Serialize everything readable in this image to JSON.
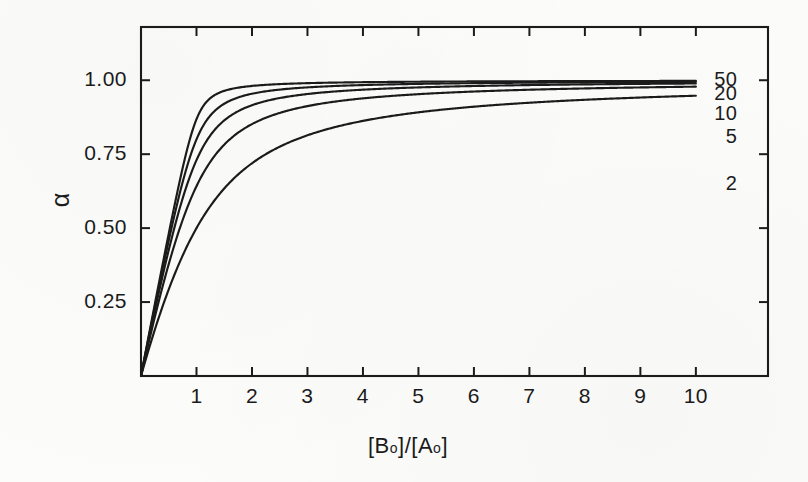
{
  "figure": {
    "background_color": "#fcfcfb",
    "ink_color": "#1b1b1b"
  },
  "chart_data": {
    "type": "line",
    "title": "",
    "xlabel": "[B₀]/[A₀]",
    "xlabel_parts": {
      "open_b": "[B",
      "sub_b": "o",
      "close_b_slash_open_a": "]/[A",
      "sub_a": "o",
      "close_a": "]"
    },
    "ylabel": "α",
    "xlim": [
      0,
      11.3
    ],
    "ylim": [
      0,
      1.18
    ],
    "xticks": [
      1,
      2,
      3,
      4,
      5,
      6,
      7,
      8,
      9,
      10
    ],
    "xtick_labels": [
      "1",
      "2",
      "3",
      "4",
      "5",
      "6",
      "7",
      "8",
      "9",
      "10"
    ],
    "yticks": [
      0.25,
      0.5,
      0.75,
      1.0
    ],
    "ytick_labels": [
      "0.25",
      "0.50",
      "0.75",
      "1.00"
    ],
    "grid": false,
    "legend_position": "right-of-curve-ends",
    "tick_direction": "in",
    "frame": "full-box",
    "series": [
      {
        "name": "50",
        "label": "50",
        "K": 50,
        "label_x": 10.75,
        "label_y": 1.0,
        "values_at_x": {
          "0": 0.0,
          "1": 0.725,
          "2": 0.875,
          "3": 0.925,
          "4": 0.948,
          "5": 0.959,
          "6": 0.967,
          "7": 0.972,
          "8": 0.976,
          "9": 0.979,
          "10": 0.981
        }
      },
      {
        "name": "20",
        "label": "20",
        "K": 20,
        "label_x": 10.75,
        "label_y": 0.952,
        "values_at_x": {
          "0": 0.0,
          "1": 0.618,
          "2": 0.793,
          "3": 0.862,
          "4": 0.897,
          "5": 0.918,
          "6": 0.932,
          "7": 0.941,
          "8": 0.948,
          "9": 0.954,
          "10": 0.958
        }
      },
      {
        "name": "10",
        "label": "10",
        "K": 10,
        "label_x": 10.75,
        "label_y": 0.885,
        "values_at_x": {
          "0": 0.0,
          "1": 0.5,
          "2": 0.686,
          "3": 0.775,
          "4": 0.826,
          "5": 0.859,
          "6": 0.881,
          "7": 0.897,
          "8": 0.909,
          "9": 0.919,
          "10": 0.927
        }
      },
      {
        "name": "5",
        "label": "5",
        "K": 5,
        "label_x": 10.75,
        "label_y": 0.805,
        "values_at_x": {
          "0": 0.0,
          "1": 0.38,
          "2": 0.553,
          "3": 0.653,
          "4": 0.717,
          "5": 0.761,
          "6": 0.793,
          "7": 0.818,
          "8": 0.837,
          "9": 0.853,
          "10": 0.866
        }
      },
      {
        "name": "2",
        "label": "2",
        "K": 2,
        "label_x": 10.75,
        "label_y": 0.648,
        "values_at_x": {
          "0": 0.0,
          "1": 0.215,
          "2": 0.343,
          "3": 0.432,
          "4": 0.5,
          "5": 0.552,
          "6": 0.594,
          "7": 0.628,
          "8": 0.657,
          "9": 0.682,
          "10": 0.703
        }
      }
    ]
  }
}
